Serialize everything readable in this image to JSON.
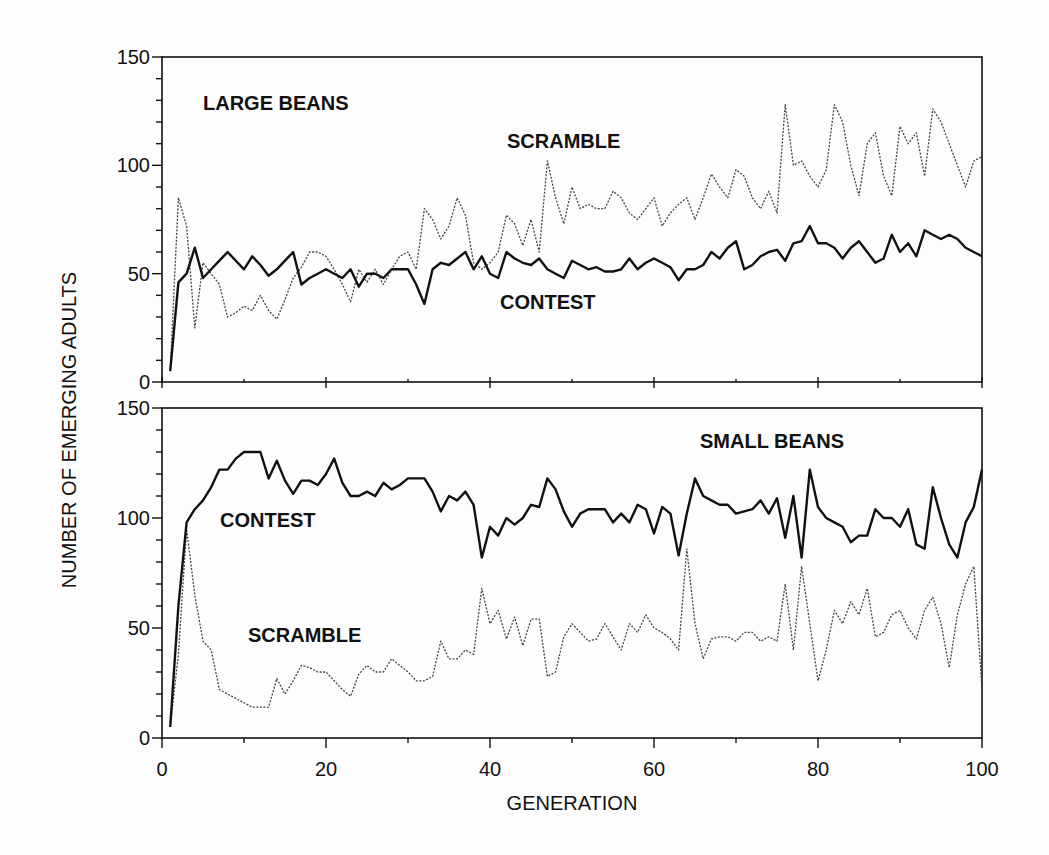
{
  "chart_data": [
    {
      "type": "line",
      "panel": "top",
      "title": "LARGE BEANS",
      "xlabel": "GENERATION",
      "ylabel": "NUMBER OF EMERGING ADULTS",
      "xlim": [
        0,
        100
      ],
      "ylim": [
        0,
        150
      ],
      "xticks": [
        0,
        20,
        40,
        60,
        80,
        100
      ],
      "yticks": [
        0,
        50,
        100,
        150
      ],
      "grid": false,
      "annotations": [
        {
          "text": "LARGE BEANS",
          "x": 5,
          "y": 120
        },
        {
          "text": "SCRAMBLE",
          "x": 42,
          "y": 110
        },
        {
          "text": "CONTEST",
          "x": 41,
          "y": 37
        }
      ],
      "x": [
        1,
        2,
        3,
        4,
        5,
        6,
        7,
        8,
        9,
        10,
        11,
        12,
        13,
        14,
        15,
        16,
        17,
        18,
        19,
        20,
        21,
        22,
        23,
        24,
        25,
        26,
        27,
        28,
        29,
        30,
        31,
        32,
        33,
        34,
        35,
        36,
        37,
        38,
        39,
        40,
        41,
        42,
        43,
        44,
        45,
        46,
        47,
        48,
        49,
        50,
        51,
        52,
        53,
        54,
        55,
        56,
        57,
        58,
        59,
        60,
        61,
        62,
        63,
        64,
        65,
        66,
        67,
        68,
        69,
        70,
        71,
        72,
        73,
        74,
        75,
        76,
        77,
        78,
        79,
        80,
        81,
        82,
        83,
        84,
        85,
        86,
        87,
        88,
        89,
        90,
        91,
        92,
        93,
        94,
        95,
        96,
        97,
        98,
        99,
        100
      ],
      "series": [
        {
          "name": "CONTEST",
          "style": "solid",
          "values": [
            5,
            46,
            50,
            62,
            48,
            52,
            56,
            60,
            56,
            52,
            58,
            54,
            49,
            52,
            56,
            60,
            45,
            48,
            50,
            52,
            50,
            48,
            52,
            44,
            50,
            50,
            48,
            52,
            52,
            52,
            45,
            36,
            52,
            55,
            54,
            57,
            60,
            52,
            58,
            50,
            48,
            60,
            57,
            55,
            54,
            57,
            52,
            50,
            48,
            56,
            54,
            52,
            53,
            51,
            51,
            52,
            57,
            52,
            55,
            57,
            55,
            53,
            47,
            52,
            52,
            54,
            60,
            57,
            62,
            65,
            52,
            54,
            58,
            60,
            61,
            56,
            64,
            65,
            72,
            64,
            64,
            62,
            57,
            62,
            65,
            60,
            55,
            57,
            68,
            60,
            64,
            58,
            70,
            68,
            66,
            68,
            66,
            62,
            60,
            58
          ]
        },
        {
          "name": "SCRAMBLE",
          "style": "dotted",
          "values": [
            5,
            85,
            72,
            25,
            55,
            50,
            45,
            30,
            32,
            35,
            33,
            40,
            33,
            29,
            38,
            48,
            53,
            60,
            60,
            58,
            52,
            45,
            37,
            52,
            46,
            52,
            45,
            52,
            58,
            60,
            52,
            80,
            75,
            66,
            72,
            85,
            77,
            55,
            52,
            55,
            60,
            77,
            73,
            63,
            75,
            60,
            102,
            85,
            73,
            90,
            80,
            82,
            80,
            80,
            88,
            85,
            78,
            75,
            80,
            85,
            72,
            78,
            82,
            85,
            75,
            85,
            96,
            90,
            85,
            98,
            95,
            85,
            80,
            88,
            78,
            128,
            100,
            102,
            95,
            90,
            98,
            128,
            120,
            100,
            86,
            110,
            115,
            95,
            86,
            118,
            110,
            115,
            95,
            126,
            120,
            110,
            100,
            90,
            102,
            104
          ]
        }
      ]
    },
    {
      "type": "line",
      "panel": "bottom",
      "title": "SMALL BEANS",
      "xlabel": "GENERATION",
      "ylabel": "NUMBER OF EMERGING ADULTS",
      "xlim": [
        0,
        100
      ],
      "ylim": [
        0,
        150
      ],
      "xticks": [
        0,
        20,
        40,
        60,
        80,
        100
      ],
      "yticks": [
        0,
        50,
        100,
        150
      ],
      "grid": false,
      "annotations": [
        {
          "text": "SMALL BEANS",
          "x": 66,
          "y": 134
        },
        {
          "text": "CONTEST",
          "x": 8,
          "y": 100
        },
        {
          "text": "SCRAMBLE",
          "x": 11,
          "y": 47
        }
      ],
      "x": [
        1,
        2,
        3,
        4,
        5,
        6,
        7,
        8,
        9,
        10,
        11,
        12,
        13,
        14,
        15,
        16,
        17,
        18,
        19,
        20,
        21,
        22,
        23,
        24,
        25,
        26,
        27,
        28,
        29,
        30,
        31,
        32,
        33,
        34,
        35,
        36,
        37,
        38,
        39,
        40,
        41,
        42,
        43,
        44,
        45,
        46,
        47,
        48,
        49,
        50,
        51,
        52,
        53,
        54,
        55,
        56,
        57,
        58,
        59,
        60,
        61,
        62,
        63,
        64,
        65,
        66,
        67,
        68,
        69,
        70,
        71,
        72,
        73,
        74,
        75,
        76,
        77,
        78,
        79,
        80,
        81,
        82,
        83,
        84,
        85,
        86,
        87,
        88,
        89,
        90,
        91,
        92,
        93,
        94,
        95,
        96,
        97,
        98,
        99,
        100
      ],
      "series": [
        {
          "name": "CONTEST",
          "style": "solid",
          "values": [
            5,
            60,
            98,
            104,
            108,
            114,
            122,
            122,
            127,
            130,
            130,
            130,
            118,
            126,
            117,
            111,
            117,
            117,
            115,
            120,
            127,
            116,
            110,
            110,
            112,
            110,
            116,
            113,
            115,
            118,
            118,
            118,
            112,
            103,
            110,
            108,
            112,
            106,
            82,
            96,
            92,
            100,
            97,
            100,
            106,
            105,
            118,
            113,
            103,
            96,
            102,
            104,
            104,
            104,
            98,
            102,
            98,
            106,
            104,
            93,
            105,
            102,
            83,
            102,
            118,
            110,
            108,
            106,
            106,
            102,
            103,
            104,
            108,
            102,
            109,
            91,
            110,
            82,
            122,
            105,
            100,
            98,
            96,
            89,
            92,
            92,
            104,
            100,
            100,
            96,
            104,
            88,
            86,
            114,
            100,
            88,
            82,
            98,
            105,
            122
          ]
        },
        {
          "name": "SCRAMBLE",
          "style": "dotted",
          "values": [
            5,
            38,
            95,
            65,
            44,
            40,
            22,
            20,
            18,
            16,
            14,
            14,
            14,
            27,
            20,
            26,
            33,
            32,
            30,
            30,
            26,
            22,
            19,
            29,
            33,
            30,
            30,
            36,
            33,
            30,
            26,
            26,
            28,
            44,
            36,
            36,
            40,
            38,
            68,
            52,
            58,
            45,
            55,
            42,
            54,
            54,
            28,
            30,
            46,
            52,
            48,
            44,
            45,
            52,
            46,
            40,
            52,
            48,
            56,
            50,
            48,
            45,
            40,
            86,
            52,
            36,
            45,
            46,
            46,
            44,
            48,
            48,
            44,
            46,
            44,
            70,
            40,
            78,
            52,
            26,
            40,
            58,
            52,
            62,
            56,
            68,
            46,
            48,
            56,
            58,
            50,
            45,
            58,
            64,
            52,
            32,
            56,
            70,
            78,
            22
          ]
        }
      ]
    }
  ],
  "labels": {
    "ylabel": "NUMBER OF EMERGING ADULTS",
    "xlabel": "GENERATION",
    "top_title": "LARGE BEANS",
    "top_scramble": "SCRAMBLE",
    "top_contest": "CONTEST",
    "bottom_title": "SMALL BEANS",
    "bottom_contest": "CONTEST",
    "bottom_scramble": "SCRAMBLE"
  },
  "axes": {
    "x_tick_labels": [
      "0",
      "20",
      "40",
      "60",
      "80",
      "100"
    ],
    "top_y_tick_labels": [
      "0",
      "50",
      "100",
      "150"
    ],
    "bottom_y_tick_labels": [
      "0",
      "50",
      "100",
      "150"
    ]
  }
}
